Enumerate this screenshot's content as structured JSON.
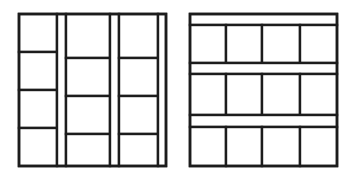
{
  "figure": {
    "name": "two-panel-layout-pattern-diagram",
    "background_color": "#ffffff",
    "stroke_color": "#1c1c1c",
    "fill_color": "#ffffff",
    "canvas": {
      "width": 356,
      "height": 189
    },
    "panel_count": 2
  },
  "panels": [
    {
      "id": "left-panel",
      "name": "vertical-strip-layout",
      "orientation": "vertical",
      "description": "Column groups subdivided horizontally, separated by full-height vertical strips",
      "box": {
        "x": 19,
        "y": 14,
        "width": 147,
        "height": 152
      },
      "outer_stroke_width": 2.6,
      "inner_stroke_width": 2.4,
      "group_count": 3,
      "strip_count": 3,
      "cells_per_group": [
        4,
        4,
        4
      ],
      "groups": [
        {
          "id": "left-group-1",
          "name": "column-group-1",
          "x": 19,
          "width": 38,
          "dividers_y": [
            52,
            90,
            128
          ]
        },
        {
          "id": "left-group-2",
          "name": "column-group-2",
          "x": 66,
          "width": 44,
          "dividers_y": [
            58,
            96,
            134
          ]
        },
        {
          "id": "left-group-3",
          "name": "column-group-3",
          "x": 119,
          "width": 39,
          "dividers_y": [
            58,
            96,
            134
          ]
        }
      ],
      "strips": [
        {
          "id": "left-strip-1",
          "name": "vertical-strip-1",
          "x": 57,
          "width": 9
        },
        {
          "id": "left-strip-2",
          "name": "vertical-strip-2",
          "x": 110,
          "width": 9
        },
        {
          "id": "left-strip-3",
          "name": "vertical-strip-edge",
          "x": 158,
          "width": 8
        }
      ]
    },
    {
      "id": "right-panel",
      "name": "horizontal-strip-layout",
      "orientation": "horizontal",
      "description": "Row bands subdivided vertically, separated by full-width horizontal strips",
      "box": {
        "x": 190,
        "y": 14,
        "width": 147,
        "height": 152
      },
      "outer_stroke_width": 2.6,
      "inner_stroke_width": 2.4,
      "group_count": 3,
      "strip_count": 3,
      "cells_per_group": [
        4,
        4,
        4
      ],
      "groups": [
        {
          "id": "right-group-1",
          "name": "row-group-1",
          "y": 25,
          "height": 38,
          "dividers_x": [
            226,
            262,
            300
          ]
        },
        {
          "id": "right-group-2",
          "name": "row-group-2",
          "y": 74,
          "height": 41,
          "dividers_x": [
            226,
            262,
            300
          ]
        },
        {
          "id": "right-group-3",
          "name": "row-group-3",
          "y": 127,
          "height": 39,
          "dividers_x": [
            226,
            262,
            300
          ]
        }
      ],
      "strips": [
        {
          "id": "right-strip-edge",
          "name": "horizontal-strip-top",
          "y": 14,
          "height": 11
        },
        {
          "id": "right-strip-1",
          "name": "horizontal-strip-1",
          "y": 63,
          "height": 11
        },
        {
          "id": "right-strip-2",
          "name": "horizontal-strip-2",
          "y": 115,
          "height": 12
        }
      ]
    }
  ]
}
